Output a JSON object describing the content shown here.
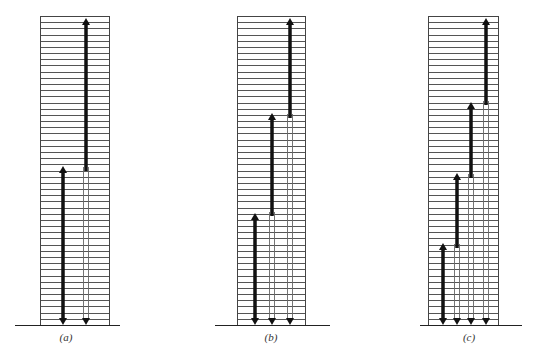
{
  "figure": {
    "panels": [
      {
        "id": "a",
        "label": "(a)",
        "box": {
          "x": 40,
          "width": 69
        },
        "label_x": 66,
        "baseline": {
          "x1": 15,
          "x2": 120
        },
        "arrows": [
          {
            "x": 63,
            "thick_top": 166,
            "thick_bottom": 325
          },
          {
            "x": 86,
            "thick_top": 18,
            "thick_bottom": 171
          }
        ]
      },
      {
        "id": "b",
        "label": "(b)",
        "box": {
          "x": 237,
          "width": 68
        },
        "label_x": 271,
        "baseline": {
          "x1": 215,
          "x2": 330
        },
        "arrows": [
          {
            "x": 255,
            "thick_top": 213,
            "thick_bottom": 325
          },
          {
            "x": 272,
            "thick_top": 113,
            "thick_bottom": 216
          },
          {
            "x": 290,
            "thick_top": 18,
            "thick_bottom": 118
          }
        ]
      },
      {
        "id": "c",
        "label": "(c)",
        "box": {
          "x": 428,
          "width": 70
        },
        "label_x": 469,
        "baseline": {
          "x1": 420,
          "x2": 522
        },
        "arrows": [
          {
            "x": 443,
            "thick_top": 243,
            "thick_bottom": 325
          },
          {
            "x": 457,
            "thick_top": 173,
            "thick_bottom": 248
          },
          {
            "x": 471,
            "thick_top": 102,
            "thick_bottom": 178
          },
          {
            "x": 486,
            "thick_top": 18,
            "thick_bottom": 105
          }
        ]
      }
    ],
    "box_top": 16,
    "box_bottom": 325,
    "rows": 50,
    "label_y": 331,
    "colors": {
      "line": "#555555",
      "arrow": "#111111",
      "thin": "#666666"
    }
  }
}
